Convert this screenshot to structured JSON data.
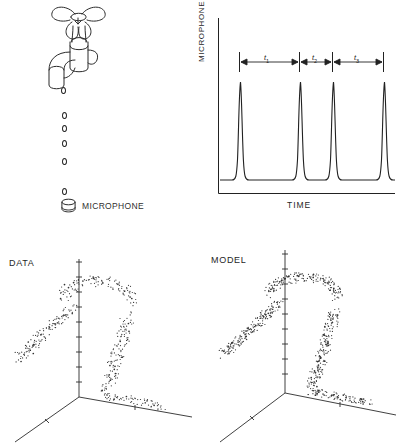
{
  "figure": {
    "caption_absent": true,
    "panels": [
      "faucet-schematic",
      "microphone-signal",
      "data-attractor",
      "model-attractor"
    ]
  },
  "faucet_panel": {
    "microphone_label": "MICROPHONE",
    "icon_faucet": "faucet-icon",
    "icon_microphone": "microphone-icon",
    "drip_count": 6,
    "drips": [
      {
        "x": 62,
        "y": 88
      },
      {
        "x": 63,
        "y": 113
      },
      {
        "x": 63,
        "y": 126
      },
      {
        "x": 63,
        "y": 141
      },
      {
        "x": 63,
        "y": 159
      },
      {
        "x": 63,
        "y": 189
      }
    ]
  },
  "signal_chart": {
    "ylabel": "MICROPHONE OUTPUT",
    "xlabel": "TIME",
    "intervals": [
      {
        "label": "t",
        "sub": "1"
      },
      {
        "label": "t",
        "sub": "2"
      },
      {
        "label": "t",
        "sub": "3"
      }
    ]
  },
  "chart_data": {
    "type": "line",
    "title": "",
    "xlabel": "TIME",
    "ylabel": "MICROPHONE OUTPUT",
    "grid": false,
    "legend": false,
    "axes_shown": [
      "left",
      "bottom"
    ],
    "tick_labels_x": [],
    "tick_labels_y": [],
    "xlim": [
      0,
      1
    ],
    "ylim": [
      0,
      1
    ],
    "peak_positions_x": [
      0.13,
      0.45,
      0.62,
      0.89
    ],
    "peak_height": 0.86,
    "baseline": 0.06,
    "peak_half_width": 0.022,
    "interval_markers": [
      {
        "name": "t1",
        "from_x": 0.13,
        "to_x": 0.45
      },
      {
        "name": "t2",
        "from_x": 0.45,
        "to_x": 0.62
      },
      {
        "name": "t3",
        "from_x": 0.62,
        "to_x": 0.89
      }
    ],
    "series": [
      {
        "name": "microphone output",
        "x": [
          0.0,
          0.05,
          0.09,
          0.11,
          0.12,
          0.13,
          0.14,
          0.15,
          0.17,
          0.22,
          0.3,
          0.38,
          0.42,
          0.44,
          0.45,
          0.46,
          0.47,
          0.49,
          0.54,
          0.58,
          0.6,
          0.61,
          0.62,
          0.63,
          0.64,
          0.66,
          0.72,
          0.8,
          0.86,
          0.88,
          0.89,
          0.9,
          0.91,
          0.94,
          1.0
        ],
        "y": [
          0.06,
          0.06,
          0.07,
          0.22,
          0.62,
          0.86,
          0.62,
          0.22,
          0.07,
          0.06,
          0.06,
          0.06,
          0.08,
          0.3,
          0.86,
          0.3,
          0.08,
          0.06,
          0.06,
          0.08,
          0.34,
          0.84,
          0.86,
          0.62,
          0.2,
          0.07,
          0.06,
          0.06,
          0.1,
          0.44,
          0.84,
          0.48,
          0.12,
          0.06,
          0.06
        ]
      }
    ]
  },
  "data_panel": {
    "tag": "DATA",
    "axes": {
      "type": "3d-axes",
      "tick_count_vertical": 10
    },
    "point_count": 430,
    "description": "Reconstructed attractor of drip intervals from experimental data."
  },
  "model_panel": {
    "tag": "MODEL",
    "axes": {
      "type": "3d-axes",
      "tick_count_vertical": 10
    },
    "point_count": 640,
    "description": "Reconstructed attractor generated by the theoretical dripping model."
  },
  "colors": {
    "ink": "#1a1a1a",
    "line": "#2b2b2b",
    "point": "#333333",
    "background": "#ffffff"
  }
}
